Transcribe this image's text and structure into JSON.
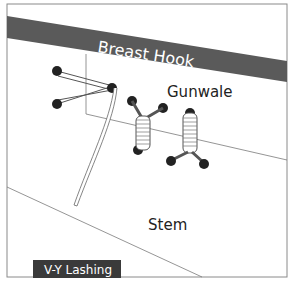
{
  "diagram": {
    "title": "V-Y Lashing",
    "labels": {
      "breast_hook": "Breast Hook",
      "gunwale": "Gunwale",
      "stem": "Stem"
    },
    "colors": {
      "band": "#5a5a5a",
      "frame": "#8a8a8a",
      "line": "#7a7a7a",
      "title_bg": "#3a3a3a",
      "text_light": "#ffffff",
      "text_dark": "#222222"
    }
  }
}
